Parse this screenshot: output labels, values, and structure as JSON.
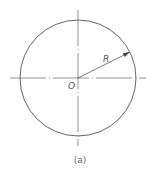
{
  "diagram": {
    "type": "circle-with-radius",
    "center_label": "O",
    "radius_label": "R",
    "caption": "(a)",
    "colors": {
      "stroke": "#555555",
      "background": "#ffffff"
    }
  }
}
